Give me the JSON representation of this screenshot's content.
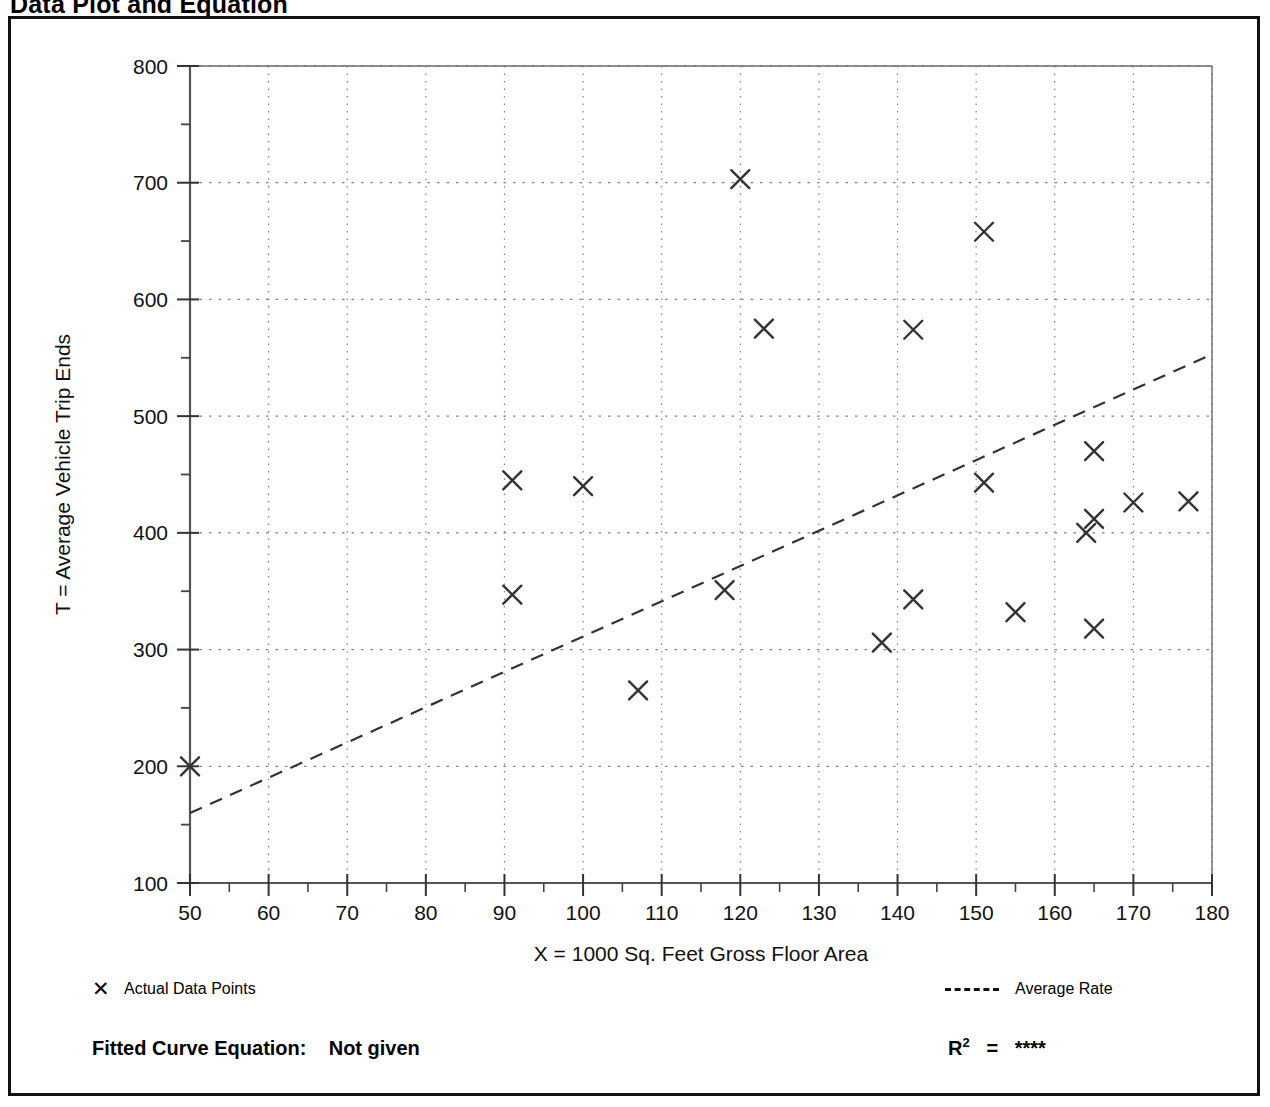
{
  "page": {
    "title": "Data Plot and Equation"
  },
  "legend": {
    "data_points_marker": "✕",
    "data_points_label": "Actual Data Points",
    "average_rate_label": "Average Rate",
    "average_rate_style": "dashed-line"
  },
  "footer": {
    "fitted_curve_label": "Fitted Curve Equation:",
    "fitted_curve_value": "Not given",
    "r_squared_label": "R",
    "r_squared_exponent": "2",
    "r_squared_equals": "=",
    "r_squared_value": "****"
  },
  "chart_data": {
    "type": "scatter",
    "title": "Data Plot and Equation",
    "xlabel": "X = 1000 Sq. Feet Gross Floor Area",
    "ylabel": "T = Average Vehicle Trip Ends",
    "xlim": [
      50,
      180
    ],
    "ylim": [
      100,
      800
    ],
    "xticks": [
      50,
      60,
      70,
      80,
      90,
      100,
      110,
      120,
      130,
      140,
      150,
      160,
      170,
      180
    ],
    "yticks": [
      100,
      200,
      300,
      400,
      500,
      600,
      700,
      800
    ],
    "x_minor_tick_step": 5,
    "y_minor_tick_step": 50,
    "grid": true,
    "grid_style": "dotted",
    "marker": "x",
    "marker_color": "#333333",
    "series": [
      {
        "name": "Actual Data Points",
        "points": [
          [
            50,
            200
          ],
          [
            91,
            445
          ],
          [
            91,
            347
          ],
          [
            100,
            440
          ],
          [
            107,
            265
          ],
          [
            118,
            351
          ],
          [
            120,
            703
          ],
          [
            123,
            575
          ],
          [
            138,
            306
          ],
          [
            142,
            343
          ],
          [
            142,
            574
          ],
          [
            151,
            443
          ],
          [
            151,
            658
          ],
          [
            155,
            332
          ],
          [
            164,
            400
          ],
          [
            165,
            412
          ],
          [
            165,
            318
          ],
          [
            165,
            470
          ],
          [
            170,
            426
          ],
          [
            177,
            427
          ]
        ]
      },
      {
        "name": "Average Rate",
        "type": "line",
        "style": "dashed",
        "color": "#333333",
        "endpoints": [
          [
            50,
            160
          ],
          [
            180,
            553
          ]
        ]
      }
    ],
    "legend_position": "below-plot",
    "annotations": {
      "fitted_curve_equation": "Not given",
      "r_squared": "****"
    }
  }
}
